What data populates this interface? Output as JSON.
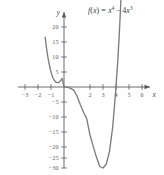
{
  "chart_data": {
    "type": "line",
    "title_parts": {
      "fname": "f",
      "open": "(",
      "var": "x",
      "close": ")",
      "equals": "=",
      "term1_base": "x",
      "term1_exp": "4",
      "minus": "−",
      "term2_coef": "4",
      "term2_base": "x",
      "term2_exp": "3"
    },
    "xlabel": "x",
    "ylabel": "y",
    "xlim": [
      -3.6,
      6.8
    ],
    "ylim": [
      -33,
      23
    ],
    "xticks": [
      -3,
      -2,
      -1,
      2,
      3,
      4,
      5,
      6
    ],
    "xtick_labels": [
      "−3",
      "−2",
      "−1",
      "2",
      "3",
      "4",
      "5",
      "6"
    ],
    "yticks": [
      20,
      15,
      10,
      5,
      -5,
      -10,
      -15,
      -20,
      -25,
      -30
    ],
    "ytick_labels": [
      "20",
      "15",
      "10",
      "5",
      "−5",
      "−10",
      "−15",
      "−20",
      "−25",
      "−30"
    ],
    "grid": false,
    "legend": "none",
    "curve_color": "#7d7d7d",
    "axis_color": "#58595b",
    "series": [
      {
        "name": "f(x) = x^4 - 4x^3",
        "x": [
          -1.45,
          -1.35,
          -1.25,
          -1.15,
          -1.05,
          -0.95,
          -0.85,
          -0.75,
          -0.65,
          -0.55,
          -0.45,
          -0.35,
          -0.25,
          -0.15,
          0.0,
          0.25,
          0.5,
          0.75,
          1.0,
          1.25,
          1.5,
          1.75,
          2.0,
          2.25,
          2.5,
          2.75,
          3.0,
          3.25,
          3.5,
          3.75,
          4.0,
          4.15,
          4.25,
          4.35,
          4.45
        ],
        "y": [
          16.62,
          13.16,
          10.25,
          7.83,
          5.85,
          4.29,
          3.09,
          2.25,
          1.7,
          1.44,
          1.45,
          1.7,
          2.17,
          2.85,
          0.0,
          -0.06,
          -0.44,
          -1.05,
          -3.0,
          -5.86,
          -8.44,
          -10.62,
          -16.0,
          -19.8,
          -23.44,
          -26.5,
          -27.0,
          -25.76,
          -21.44,
          -13.18,
          0.0,
          9.63,
          17.35,
          26.36,
          36.78
        ]
      }
    ],
    "roots": [
      0,
      4
    ],
    "minimum": {
      "x": 3,
      "y": -27
    }
  },
  "figure": {
    "background": "#ffffff",
    "arrow_heads": [
      "x-axis-right",
      "y-axis-top"
    ]
  }
}
